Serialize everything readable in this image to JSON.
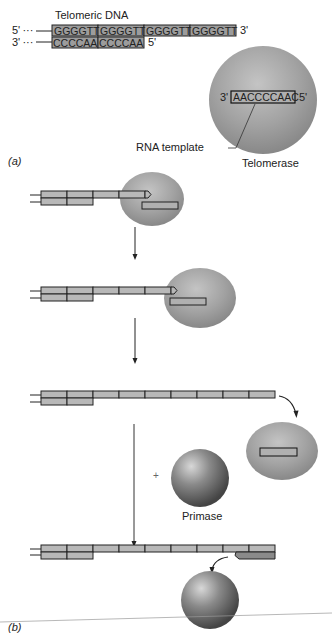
{
  "figure": {
    "panel_a": {
      "label": "(a)",
      "title": "Telomeric DNA",
      "top_strand": {
        "five_prime": "5' ···",
        "repeats": [
          "GGGGTT",
          "GGGGTT",
          "GGGGTT",
          "GGGGTT"
        ],
        "three_prime": "3'"
      },
      "bottom_strand": {
        "three_prime": "3' ···",
        "repeats": [
          "CCCCAA",
          "CCCCAA"
        ],
        "five_prime": "5'"
      },
      "enzyme": {
        "name": "Telomerase",
        "template_sequence": "AACCCCAAC",
        "template_left_end": "3'",
        "template_right_end": "5'",
        "template_callout": "RNA template"
      }
    },
    "panel_b": {
      "label": "(b)",
      "plus_sign": "+",
      "primase_label": "Primase",
      "steps": [
        {
          "step": 1,
          "top_segments": 4,
          "bottom_segments": 2,
          "telomerase_bound": true
        },
        {
          "step": 2,
          "top_segments": 5,
          "bottom_segments": 2,
          "telomerase_bound": true
        },
        {
          "step": 3,
          "top_segments": 9,
          "bottom_segments": 2,
          "telomerase_bound": false
        },
        {
          "step": 4,
          "top_segments": 9,
          "bottom_segments": 2,
          "primer_added": true,
          "primase_leaving": true
        }
      ]
    },
    "colors": {
      "dna_fill": "#b8b8b8",
      "dna_stroke": "#1a1a1a",
      "telomerase": "#9a9a9a",
      "primase": "#6a6a6a"
    }
  }
}
